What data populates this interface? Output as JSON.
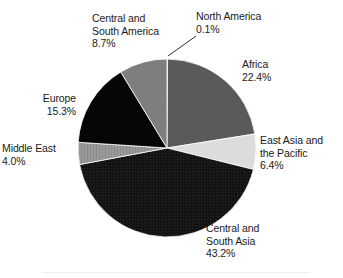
{
  "chart_data": {
    "type": "pie",
    "title": "",
    "subtitle": "",
    "xlabel": "",
    "ylabel": "",
    "legend_position": "none",
    "labels_position": "outside-with-leader-lines",
    "units": "percent",
    "start_angle_deg": 0,
    "direction": "clockwise",
    "categories": [
      "North America",
      "Africa",
      "East Asia and the Pacific",
      "Central and South Asia",
      "Middle East",
      "Europe",
      "Central and South America"
    ],
    "values": [
      0.1,
      22.4,
      6.4,
      43.2,
      4.0,
      15.3,
      8.7
    ],
    "slices": [
      {
        "name": "North America",
        "label_lines": "North America\n0.1%",
        "value": 0.1,
        "value_text": "0.1%",
        "color": "#8d8d8d",
        "has_leader_line": true
      },
      {
        "name": "Africa",
        "label_lines": "Africa\n22.4%",
        "value": 22.4,
        "value_text": "22.4%",
        "color": "#5a5a5a",
        "has_leader_line": false
      },
      {
        "name": "East Asia and the Pacific",
        "label_lines": "East Asia and\nthe Pacific\n6.4%",
        "value": 6.4,
        "value_text": "6.4%",
        "color": "#dcdcdc",
        "has_leader_line": false
      },
      {
        "name": "Central and South Asia",
        "label_lines": "Central and\nSouth Asia\n43.2%",
        "value": 43.2,
        "value_text": "43.2%",
        "color": "#151515",
        "has_leader_line": false
      },
      {
        "name": "Middle East",
        "label_lines": "Middle East\n4.0%",
        "value": 4.0,
        "value_text": "4.0%",
        "color": "#9a9a9a",
        "has_leader_line": false
      },
      {
        "name": "Europe",
        "label_lines": "Europe\n15.3%",
        "value": 15.3,
        "value_text": "15.3%",
        "color": "#060606",
        "has_leader_line": false
      },
      {
        "name": "Central and South America",
        "label_lines": "Central and\nSouth America\n8.7%",
        "value": 8.7,
        "value_text": "8.7%",
        "color": "#7e7e7e",
        "has_leader_line": false
      }
    ]
  },
  "labels": {
    "north_america": "North America\n0.1%",
    "africa": "Africa\n22.4%",
    "east_asia_pacific": "East Asia and\nthe Pacific\n6.4%",
    "central_south_asia": "Central and\nSouth Asia\n43.2%",
    "middle_east": "Middle East\n4.0%",
    "europe": "Europe\n15.3%",
    "central_south_america": "Central and\nSouth America\n8.7%"
  },
  "geometry": {
    "center_x": 167,
    "center_y": 148,
    "radius": 89
  },
  "colors": {
    "background": "#ffffff",
    "text": "#1a1a1a",
    "slice_outline": "#ffffff"
  }
}
